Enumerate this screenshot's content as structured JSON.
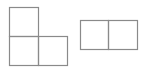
{
  "diagram": {
    "stroke_color": "#8a8a8a",
    "background": "#ffffff",
    "shapes": [
      {
        "name": "l-triomino",
        "cells": [
          {
            "x": 9,
            "y": 7,
            "w": 29,
            "h": 29
          },
          {
            "x": 9,
            "y": 36,
            "w": 29,
            "h": 29
          },
          {
            "x": 38,
            "y": 36,
            "w": 29,
            "h": 29
          }
        ]
      },
      {
        "name": "domino",
        "cells": [
          {
            "x": 80,
            "y": 20,
            "w": 28,
            "h": 29
          },
          {
            "x": 108,
            "y": 20,
            "w": 29,
            "h": 29
          }
        ]
      }
    ]
  }
}
